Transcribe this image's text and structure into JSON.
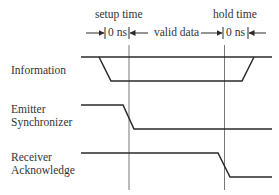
{
  "diagram": {
    "type": "timing-diagram",
    "header": {
      "setup_label": "setup time",
      "setup_value": "0 ns",
      "middle_label": "valid data",
      "hold_label": "hold time",
      "hold_value": "0 ns"
    },
    "signals": [
      {
        "name": "Information",
        "lines": [
          "Information"
        ]
      },
      {
        "name": "Emitter Synchronizer",
        "lines": [
          "Emitter",
          "Synchronizer"
        ]
      },
      {
        "name": "Receiver Acknowledge",
        "lines": [
          "Receiver",
          "Acknowledge"
        ]
      }
    ],
    "colors": {
      "line": "#2a2a2a",
      "guide": "#555555",
      "background": "#ffffff"
    }
  }
}
